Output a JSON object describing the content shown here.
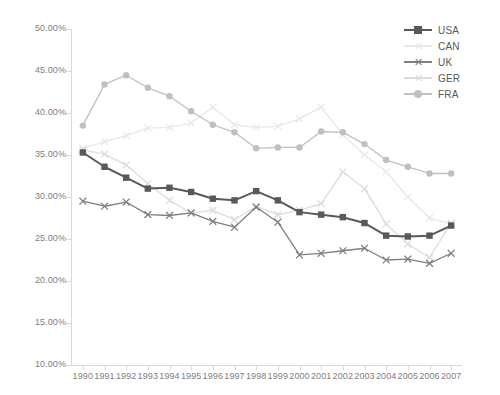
{
  "chart_data": {
    "type": "line",
    "title": "",
    "subtitle": "",
    "xlabel": "",
    "ylabel": "",
    "grid": false,
    "legend_position": "top-right",
    "x": [
      1990,
      1991,
      1992,
      1993,
      1994,
      1995,
      1996,
      1997,
      1998,
      1999,
      2000,
      2001,
      2002,
      2003,
      2004,
      2005,
      2006,
      2007
    ],
    "categories": [
      "1990",
      "1991",
      "1992",
      "1993",
      "1994",
      "1995",
      "1996",
      "1997",
      "1998",
      "1999",
      "2000",
      "2001",
      "2002",
      "2003",
      "2004",
      "2005",
      "2006",
      "2007"
    ],
    "ylim": [
      10,
      50
    ],
    "ytick_values": [
      50,
      45,
      40,
      35,
      30,
      25,
      20,
      15,
      10
    ],
    "ytick_labels": [
      "50.00%",
      "45.00%",
      "40.00%",
      "35.00%",
      "30.00%",
      "25.00%",
      "20.00%",
      "15.00%",
      "10.00%"
    ],
    "y_unit": "%",
    "series": [
      {
        "name": "USA",
        "color": "#595959",
        "marker": "square",
        "values": [
          35.3,
          33.6,
          32.3,
          31.0,
          31.1,
          30.6,
          29.8,
          29.6,
          30.7,
          29.6,
          28.2,
          27.9,
          27.6,
          26.9,
          25.4,
          25.3,
          25.4,
          26.6
        ]
      },
      {
        "name": "CAN",
        "color": "#e8e8e8",
        "marker": "x",
        "values": [
          35.8,
          36.6,
          37.3,
          38.2,
          38.3,
          38.8,
          40.7,
          38.6,
          38.3,
          38.4,
          39.3,
          40.7,
          37.4,
          35.0,
          33.0,
          30.0,
          27.5,
          26.8
        ]
      },
      {
        "name": "UK",
        "color": "#7f7f7f",
        "marker": "x",
        "values": [
          29.5,
          28.9,
          29.4,
          27.9,
          27.8,
          28.1,
          27.1,
          26.4,
          28.8,
          27.0,
          23.1,
          23.3,
          23.6,
          23.9,
          22.5,
          22.6,
          22.1,
          23.3
        ]
      },
      {
        "name": "GER",
        "color": "#dcdcdc",
        "marker": "x",
        "values": [
          35.6,
          35.1,
          33.8,
          31.6,
          29.6,
          28.1,
          28.4,
          27.3,
          28.9,
          27.9,
          28.4,
          29.2,
          33.0,
          31.0,
          26.8,
          24.4,
          22.8,
          26.9
        ]
      },
      {
        "name": "FRA",
        "color": "#c0c0c0",
        "marker": "circle",
        "values": [
          38.5,
          43.4,
          44.5,
          43.0,
          42.0,
          40.2,
          38.6,
          37.7,
          35.8,
          35.9,
          35.9,
          37.8,
          37.7,
          36.3,
          34.4,
          33.6,
          32.8,
          32.8
        ]
      }
    ]
  },
  "legend": {
    "items": [
      {
        "label": "USA"
      },
      {
        "label": "CAN"
      },
      {
        "label": "UK"
      },
      {
        "label": "GER"
      },
      {
        "label": "FRA"
      }
    ]
  }
}
